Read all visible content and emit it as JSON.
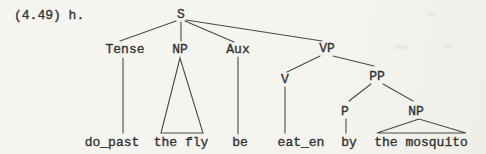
{
  "caption": "(4.49) h.",
  "colors": {
    "background": "#f5f4f0",
    "ink": "#333333",
    "line": "#4a4a4a"
  },
  "tree": {
    "nodes": {
      "s": "S",
      "tense": "Tense",
      "np_subject": "NP",
      "aux": "Aux",
      "vp": "VP",
      "v": "V",
      "pp": "PP",
      "p": "P",
      "np_object": "NP"
    },
    "leaves": {
      "do_past": "do_past",
      "the_fly": "the fly",
      "be": "be",
      "eat_en": "eat_en",
      "by": "by",
      "the_mosquito": "the mosquito"
    }
  }
}
